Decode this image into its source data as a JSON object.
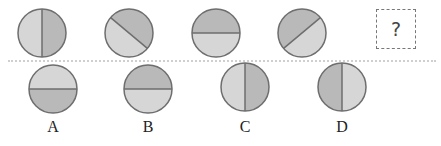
{
  "puzzle": {
    "question_mark": "?",
    "colors": {
      "light": "#d6d6d6",
      "dark": "#b9b9b9",
      "stroke": "#6e6e6e"
    },
    "sequence": [
      {
        "name": "figure-1",
        "cx": 42,
        "cy": 33,
        "r": 24,
        "line": "vertical",
        "dark_side": "right"
      },
      {
        "name": "figure-2",
        "cx": 129,
        "cy": 33,
        "r": 24,
        "line": "diagonal-down",
        "dark_side": "upper-right"
      },
      {
        "name": "figure-3",
        "cx": 216,
        "cy": 33,
        "r": 24,
        "line": "horizontal",
        "dark_side": "top"
      },
      {
        "name": "figure-4",
        "cx": 302,
        "cy": 33,
        "r": 24,
        "line": "diagonal-up",
        "dark_side": "upper-left"
      }
    ],
    "options": [
      {
        "label": "A",
        "cx": 53,
        "cy": 89,
        "r": 24,
        "line": "horizontal",
        "dark_side": "bottom"
      },
      {
        "label": "B",
        "cx": 148,
        "cy": 89,
        "r": 24,
        "line": "horizontal",
        "dark_side": "top"
      },
      {
        "label": "C",
        "cx": 245,
        "cy": 87,
        "r": 24,
        "line": "vertical",
        "dark_side": "right"
      },
      {
        "label": "D",
        "cx": 342,
        "cy": 87,
        "r": 24,
        "line": "vertical",
        "dark_side": "left"
      }
    ]
  }
}
